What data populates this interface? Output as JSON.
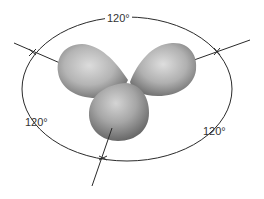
{
  "diagram": {
    "labels": {
      "top": "120°",
      "left": "120°",
      "right": "120°"
    },
    "lobes": [
      {
        "name": "left-lobe",
        "direction": "upper-left"
      },
      {
        "name": "right-lobe",
        "direction": "upper-right"
      },
      {
        "name": "bottom-lobe",
        "direction": "lower"
      }
    ],
    "colors": {
      "lobe_light": "#d8d8d8",
      "lobe_mid": "#a8a8a8",
      "lobe_dark": "#6e6e6e",
      "line": "#2a2a2a",
      "text": "#333333"
    }
  }
}
